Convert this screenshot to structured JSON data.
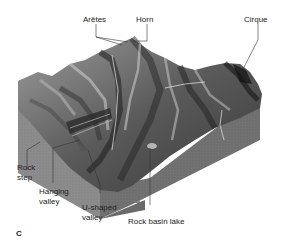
{
  "figure": {
    "panel_letter": "C",
    "labels": [
      {
        "id": "aretes",
        "text": "Arêtes"
      },
      {
        "id": "horn",
        "text": "Horn"
      },
      {
        "id": "cirque",
        "text": "Cirque"
      },
      {
        "id": "rock_step_1",
        "text": "Rock"
      },
      {
        "id": "rock_step_2",
        "text": "step"
      },
      {
        "id": "hanging_valley_1",
        "text": "Hanging"
      },
      {
        "id": "hanging_valley_2",
        "text": "valley"
      },
      {
        "id": "u_valley_1",
        "text": "U-shaped"
      },
      {
        "id": "u_valley_2",
        "text": "valley"
      },
      {
        "id": "rock_basin_lake",
        "text": "Rock basin lake"
      }
    ],
    "colors": {
      "block_side_left": "#8a8a8a",
      "block_side_right": "#6f6f6f",
      "terrain_light": "#b8b8b8",
      "terrain_dark": "#2a2a2a",
      "leader_line": "#333333",
      "text": "#222222"
    }
  }
}
